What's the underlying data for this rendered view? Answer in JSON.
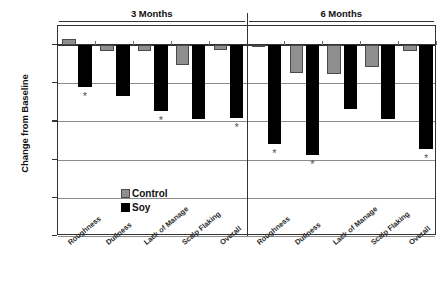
{
  "chart_data": {
    "type": "bar",
    "title": "",
    "xlabel": "",
    "ylabel": "Change from Baseline",
    "ylim": [
      -1.5,
      0.15
    ],
    "yticks": [
      "0",
      "-0.3",
      "-0.6",
      "-0.9",
      "-1.2",
      "-1.5"
    ],
    "ytick_values": [
      0,
      -0.3,
      -0.6,
      -0.9,
      -1.2,
      -1.5
    ],
    "grid": true,
    "legend_position": "inside-left",
    "groups": [
      {
        "label": "3 Months",
        "categories": [
          "Roughness",
          "Dullness",
          "Lack of Manage",
          "Scalp Flaking",
          "Overall"
        ],
        "series": [
          {
            "name": "Control",
            "values": [
              0.05,
              -0.05,
              -0.05,
              -0.16,
              -0.04
            ]
          },
          {
            "name": "Soy",
            "values": [
              -0.33,
              -0.4,
              -0.52,
              -0.58,
              -0.57
            ]
          }
        ],
        "significance": [
          {
            "category": "Roughness",
            "marker": "*"
          },
          {
            "category": "Lack of Manage",
            "marker": "*"
          },
          {
            "category": "Overall",
            "marker": "*"
          }
        ]
      },
      {
        "label": "6 Months",
        "categories": [
          "Roughness",
          "Dullness",
          "Lack of Manage",
          "Scalp Flaking",
          "Overall"
        ],
        "series": [
          {
            "name": "Control",
            "values": [
              0.0,
              -0.22,
              -0.23,
              -0.17,
              -0.05
            ]
          },
          {
            "name": "Soy",
            "values": [
              -0.78,
              -0.86,
              -0.5,
              -0.58,
              -0.82
            ]
          }
        ],
        "significance": [
          {
            "category": "Roughness",
            "marker": "*"
          },
          {
            "category": "Dullness",
            "marker": "*"
          },
          {
            "category": "Overall",
            "marker": "*"
          }
        ]
      }
    ],
    "legend": [
      {
        "label": "Control",
        "color": "#8f8f8f"
      },
      {
        "label": "Soy",
        "color": "#000000"
      }
    ],
    "colors": {
      "control": "#8f8f8f",
      "soy": "#000000",
      "axis": "#333333",
      "grid": "#8b8b8b"
    }
  }
}
